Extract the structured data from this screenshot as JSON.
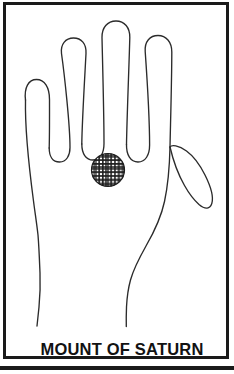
{
  "figure": {
    "name": "palmistry-hand-chart",
    "caption": "MOUNT OF SATURN",
    "colors": {
      "frame": "#1a1a1a",
      "background": "#ffffff",
      "line": "#2b2b2b",
      "marker_fill": "#1c1c1c",
      "caption": "#121212"
    },
    "marker": {
      "label": "mount-of-saturn-region",
      "shape": "circle",
      "pattern": "cross-hatch",
      "center_x": 105,
      "center_y": 167,
      "radius": 16
    },
    "digits": [
      {
        "name": "pinky-finger",
        "tip_x": 34,
        "tip_y": 90
      },
      {
        "name": "ring-finger",
        "tip_x": 67,
        "tip_y": 54
      },
      {
        "name": "middle-finger",
        "tip_x": 102,
        "tip_y": 38
      },
      {
        "name": "index-finger",
        "tip_x": 145,
        "tip_y": 57
      },
      {
        "name": "thumb",
        "tip_x": 208,
        "tip_y": 154
      }
    ],
    "wrist": {
      "left_x": 45,
      "right_x": 143,
      "y": 312
    }
  }
}
